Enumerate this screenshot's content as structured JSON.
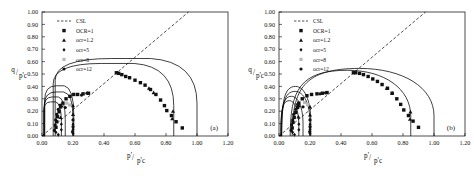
{
  "figure": {
    "panels": [
      {
        "tag": "(a)",
        "name": "panel-a",
        "curve_style": "angular"
      },
      {
        "tag": "(b)",
        "name": "panel-b",
        "curve_style": "rounded"
      }
    ]
  },
  "axes": {
    "x_title_num": "p'",
    "x_title_den": "p'c",
    "y_title_num": "q",
    "y_title_den": "p'c",
    "x_ticks": [
      "0.00",
      "0.20",
      "0.40",
      "0.60",
      "0.80",
      "1.00",
      "1.20"
    ],
    "y_ticks": [
      "0.00",
      "0.10",
      "0.20",
      "0.30",
      "0.40",
      "0.50",
      "0.60",
      "0.70",
      "0.80",
      "0.90",
      "1.00"
    ],
    "xlim": [
      0.0,
      1.2
    ],
    "ylim": [
      0.0,
      1.0
    ]
  },
  "legend": {
    "entries": [
      {
        "label": "CSL",
        "marker": "dashed-line"
      },
      {
        "label": "OCR=1",
        "marker": "filled-square"
      },
      {
        "label": "ocr=1.2",
        "marker": "filled-triangle"
      },
      {
        "label": "ocr=5",
        "marker": "filled-diamond"
      },
      {
        "label": "ocr=8",
        "marker": "light-square"
      },
      {
        "label": "ocr=12",
        "marker": "filled-circle"
      }
    ]
  },
  "chart_data": {
    "type": "scatter",
    "title": "",
    "xlabel": "p'/p'c",
    "ylabel": "q/p'c",
    "xlim": [
      0.0,
      1.2
    ],
    "ylim": [
      0.0,
      1.0
    ],
    "grid": false,
    "legend_position": "upper-left",
    "panels": [
      {
        "tag": "(a)",
        "csl": {
          "slope": 1.06,
          "from": [
            0.0,
            0.0
          ],
          "to": [
            0.945,
            1.0
          ]
        },
        "series": [
          {
            "name": "OCR=1",
            "marker": "filled-square",
            "points": [
              [
                0.48,
                0.51
              ],
              [
                0.495,
                0.505
              ],
              [
                0.515,
                0.495
              ],
              [
                0.54,
                0.48
              ],
              [
                0.565,
                0.47
              ],
              [
                0.6,
                0.45
              ],
              [
                0.635,
                0.43
              ],
              [
                0.665,
                0.41
              ],
              [
                0.7,
                0.375
              ],
              [
                0.735,
                0.335
              ],
              [
                0.765,
                0.29
              ],
              [
                0.79,
                0.245
              ],
              [
                0.805,
                0.205
              ],
              [
                0.835,
                0.165
              ],
              [
                0.865,
                0.115
              ],
              [
                0.905,
                0.065
              ],
              [
                0.09,
                0.07
              ],
              [
                0.095,
                0.115
              ],
              [
                0.1,
                0.155
              ],
              [
                0.11,
                0.195
              ],
              [
                0.12,
                0.235
              ],
              [
                0.135,
                0.265
              ],
              [
                0.155,
                0.3
              ],
              [
                0.18,
                0.32
              ],
              [
                0.205,
                0.335
              ],
              [
                0.23,
                0.335
              ],
              [
                0.265,
                0.34
              ],
              [
                0.3,
                0.345
              ]
            ]
          },
          {
            "name": "ocr=1.2",
            "marker": "filled-triangle",
            "points": [
              [
                0.84,
                0.14
              ],
              [
                0.845,
                0.2
              ],
              [
                0.72,
                0.35
              ],
              [
                0.69,
                0.385
              ],
              [
                0.2,
                0.245
              ],
              [
                0.2,
                0.175
              ],
              [
                0.125,
                0.245
              ],
              [
                0.12,
                0.15
              ]
            ]
          },
          {
            "name": "ocr=5",
            "marker": "filled-diamond",
            "points": [
              [
                0.2,
                0.095
              ],
              [
                0.2,
                0.055
              ],
              [
                0.2,
                0.02
              ],
              [
                0.125,
                0.095
              ],
              [
                0.125,
                0.05
              ],
              [
                0.09,
                0.03
              ],
              [
                0.105,
                0.01
              ]
            ]
          },
          {
            "name": "ocr=8",
            "marker": "light-square",
            "points": [
              [
                0.16,
                0.265
              ],
              [
                0.178,
                0.25
              ]
            ]
          },
          {
            "name": "ocr=12",
            "marker": "filled-circle",
            "points": [
              [
                0.08,
                0.045
              ],
              [
                0.085,
                0.09
              ],
              [
                0.088,
                0.13
              ],
              [
                0.095,
                0.175
              ],
              [
                0.105,
                0.215
              ],
              [
                0.118,
                0.25
              ],
              [
                0.2,
                0.13
              ],
              [
                0.2,
                0.075
              ],
              [
                0.197,
                0.035
              ],
              [
                0.15,
                0.23
              ],
              [
                0.255,
                0.33
              ],
              [
                0.29,
                0.345
              ]
            ]
          }
        ],
        "yield_surfaces": [
          {
            "name": "ocr-12-small",
            "type": "angular",
            "p_max": 0.125,
            "q_peak": 0.275
          },
          {
            "name": "ocr-8",
            "type": "angular",
            "p_max": 0.15,
            "q_peak": 0.315
          },
          {
            "name": "ocr-5",
            "type": "angular",
            "p_max": 0.2,
            "q_peak": 0.355
          },
          {
            "name": "ocr-1.2",
            "type": "angular",
            "p_max": 0.205,
            "q_peak": 0.405
          },
          {
            "name": "OCR-1-inner",
            "type": "angular",
            "p_max": 0.85,
            "q_peak": 0.585
          },
          {
            "name": "OCR-1-outer",
            "type": "angular",
            "p_max": 1.0,
            "q_peak": 0.625
          }
        ]
      },
      {
        "tag": "(b)",
        "csl": {
          "slope": 1.06,
          "from": [
            0.0,
            0.0
          ],
          "to": [
            0.945,
            1.0
          ]
        },
        "series": [
          {
            "name": "OCR=1",
            "marker": "filled-square",
            "points": [
              [
                0.48,
                0.51
              ],
              [
                0.495,
                0.51
              ],
              [
                0.52,
                0.505
              ],
              [
                0.545,
                0.495
              ],
              [
                0.575,
                0.48
              ],
              [
                0.605,
                0.46
              ],
              [
                0.635,
                0.44
              ],
              [
                0.665,
                0.415
              ],
              [
                0.7,
                0.385
              ],
              [
                0.73,
                0.345
              ],
              [
                0.76,
                0.3
              ],
              [
                0.785,
                0.255
              ],
              [
                0.805,
                0.21
              ],
              [
                0.835,
                0.165
              ],
              [
                0.865,
                0.12
              ],
              [
                0.9,
                0.07
              ],
              [
                0.085,
                0.065
              ],
              [
                0.09,
                0.11
              ],
              [
                0.098,
                0.15
              ],
              [
                0.108,
                0.19
              ],
              [
                0.12,
                0.23
              ],
              [
                0.128,
                0.265
              ],
              [
                0.15,
                0.3
              ],
              [
                0.18,
                0.325
              ],
              [
                0.21,
                0.335
              ],
              [
                0.245,
                0.34
              ],
              [
                0.28,
                0.345
              ],
              [
                0.31,
                0.35
              ]
            ]
          },
          {
            "name": "ocr=1.2",
            "marker": "filled-triangle",
            "points": [
              [
                0.845,
                0.135
              ],
              [
                0.848,
                0.195
              ],
              [
                0.73,
                0.345
              ],
              [
                0.695,
                0.385
              ],
              [
                0.2,
                0.235
              ],
              [
                0.2,
                0.17
              ],
              [
                0.128,
                0.245
              ],
              [
                0.125,
                0.155
              ]
            ]
          },
          {
            "name": "ocr=5",
            "marker": "filled-diamond",
            "points": [
              [
                0.2,
                0.095
              ],
              [
                0.2,
                0.055
              ],
              [
                0.2,
                0.02
              ],
              [
                0.128,
                0.095
              ],
              [
                0.128,
                0.05
              ],
              [
                0.088,
                0.03
              ],
              [
                0.1,
                0.01
              ]
            ]
          },
          {
            "name": "ocr=8",
            "marker": "light-square",
            "points": [
              [
                0.165,
                0.27
              ],
              [
                0.185,
                0.255
              ]
            ]
          },
          {
            "name": "ocr=12",
            "marker": "filled-circle",
            "points": [
              [
                0.078,
                0.045
              ],
              [
                0.082,
                0.09
              ],
              [
                0.088,
                0.13
              ],
              [
                0.095,
                0.175
              ],
              [
                0.108,
                0.215
              ],
              [
                0.12,
                0.255
              ],
              [
                0.2,
                0.13
              ],
              [
                0.2,
                0.075
              ],
              [
                0.198,
                0.035
              ],
              [
                0.155,
                0.235
              ],
              [
                0.265,
                0.34
              ],
              [
                0.3,
                0.348
              ]
            ]
          }
        ],
        "yield_surfaces": [
          {
            "name": "ocr-12-small",
            "type": "rounded",
            "p_max": 0.128,
            "q_peak": 0.285
          },
          {
            "name": "ocr-8",
            "type": "rounded",
            "p_max": 0.155,
            "q_peak": 0.32
          },
          {
            "name": "ocr-5",
            "type": "rounded",
            "p_max": 0.2,
            "q_peak": 0.36
          },
          {
            "name": "ocr-1.2",
            "type": "rounded",
            "p_max": 0.205,
            "q_peak": 0.4
          },
          {
            "name": "OCR-1-inner",
            "type": "rounded",
            "p_max": 0.85,
            "q_peak": 0.53
          },
          {
            "name": "OCR-1-outer",
            "type": "rounded",
            "p_max": 1.0,
            "q_peak": 0.545
          }
        ]
      }
    ]
  }
}
